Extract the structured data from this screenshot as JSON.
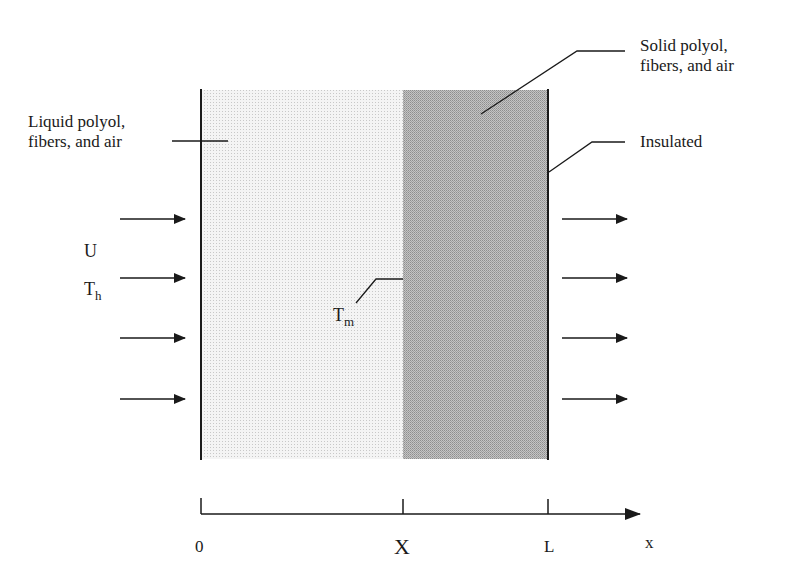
{
  "diagram": {
    "regions": {
      "liquid": {
        "label_line1": "Liquid polyol,",
        "label_line2": "fibers, and air",
        "fill": "#ececec"
      },
      "solid": {
        "label_line1": "Solid polyol,",
        "label_line2": "fibers, and air",
        "fill": "#b8b8b8"
      },
      "boundary_right": {
        "label": "Insulated"
      }
    },
    "inflow": {
      "velocity_label": "U",
      "temperature_label": "T",
      "temperature_subscript": "h"
    },
    "interface": {
      "temperature_label": "T",
      "temperature_subscript": "m"
    },
    "axis": {
      "ticks": [
        "0",
        "X",
        "L"
      ],
      "variable": "x"
    },
    "colors": {
      "ink": "#1a1a1a",
      "liquid_fill": "#ececec",
      "solid_fill": "#b8b8b8"
    }
  }
}
